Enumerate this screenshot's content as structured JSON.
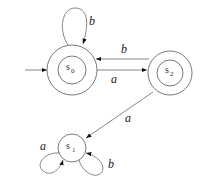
{
  "diagram": {
    "type": "finite-automaton",
    "start_state": "s0",
    "states": [
      {
        "id": "s0",
        "label": "s",
        "subscript": "0",
        "accepting": true
      },
      {
        "id": "s1",
        "label": "s",
        "subscript": "1",
        "accepting": false
      },
      {
        "id": "s2",
        "label": "s",
        "subscript": "2",
        "accepting": true
      }
    ],
    "transitions": [
      {
        "from": "s0",
        "to": "s0",
        "label": "b"
      },
      {
        "from": "s0",
        "to": "s2",
        "label": "a"
      },
      {
        "from": "s2",
        "to": "s0",
        "label": "b"
      },
      {
        "from": "s2",
        "to": "s1",
        "label": "a"
      },
      {
        "from": "s1",
        "to": "s1",
        "label": "a"
      },
      {
        "from": "s1",
        "to": "s1",
        "label": "b"
      }
    ]
  },
  "labels": {
    "s0_main": "s",
    "s0_sub": "0",
    "s1_main": "s",
    "s1_sub": "1",
    "s2_main": "s",
    "s2_sub": "2",
    "loop_s0": "b",
    "edge_s0_s2": "a",
    "edge_s2_s0": "b",
    "edge_s2_s1": "a",
    "loop_s1_left": "a",
    "loop_s1_right": "b"
  }
}
